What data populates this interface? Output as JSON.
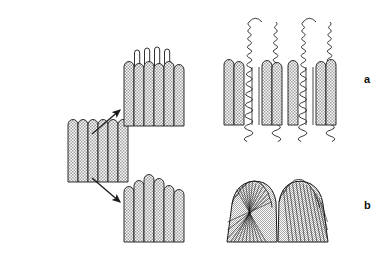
{
  "figure": {
    "type": "morphology-schematic",
    "background_color": "#ffffff",
    "stroke_color": "#1a1a1a",
    "fill_stipple_color": "#b9b9b9",
    "fill_light_color": "#ffffff",
    "panels": [
      {
        "id": "a",
        "label": "a",
        "label_x": 364,
        "label_y": 73
      },
      {
        "id": "b",
        "label": "b",
        "label_x": 364,
        "label_y": 199
      }
    ]
  },
  "stages": {
    "initial": {
      "name": "initial-palisade",
      "x": 68,
      "y": 120,
      "width": 60,
      "height": 62,
      "column_count": 6,
      "column_width": 10,
      "cap_style": "rounded",
      "fill": "stipple"
    },
    "row_a_middle": {
      "name": "elongating-palisade-with-loops",
      "x": 124,
      "y": 48,
      "width": 62,
      "height": 78,
      "column_count": 6,
      "column_width": 10,
      "loop_count": 4,
      "loop_width": 5,
      "loop_rise": 14,
      "fill": "stipple"
    },
    "row_a_right": {
      "name": "spiral-coil-outgrowths",
      "x": 224,
      "y": 12,
      "width": 114,
      "height": 113,
      "base_column_count": 8,
      "spiral_count": 4,
      "spiral_pairs": 2,
      "coil_turns": 17,
      "taper": "pointed-apex",
      "fill": "stipple"
    },
    "row_b_middle": {
      "name": "domed-palisade",
      "x": 124,
      "y": 178,
      "width": 62,
      "height": 64,
      "column_count": 6,
      "column_width": 10,
      "profile": "dome",
      "fill": "stipple"
    },
    "row_b_right": {
      "name": "radiating-fan-structures",
      "x": 224,
      "y": 178,
      "width": 108,
      "height": 64,
      "fan_count": 2,
      "rays_per_fan": 13,
      "crown_style": "scalloped",
      "fill": "stipple"
    }
  },
  "arrows": [
    {
      "name": "arrow-to-row-a",
      "x1": 92,
      "y1": 134,
      "x2": 120,
      "y2": 110
    },
    {
      "name": "arrow-to-row-b",
      "x1": 92,
      "y1": 178,
      "x2": 120,
      "y2": 202
    }
  ]
}
